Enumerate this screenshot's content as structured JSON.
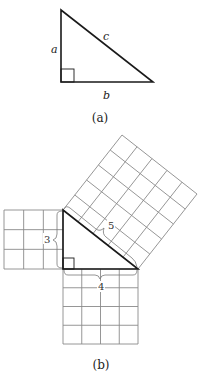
{
  "figure_a": {
    "caption": "(a)",
    "labels": {
      "leg_vertical": "a",
      "leg_horizontal": "b",
      "hypotenuse": "c"
    }
  },
  "figure_b": {
    "caption": "(b)",
    "side_lengths": {
      "short_leg": 3,
      "long_leg": 4,
      "hypotenuse": 5
    },
    "labels": {
      "short_leg": "3",
      "long_leg": "4",
      "hypotenuse": "5"
    },
    "squares": [
      {
        "name": "square-on-short-leg",
        "grid": 3
      },
      {
        "name": "square-on-long-leg",
        "grid": 4
      },
      {
        "name": "square-on-hypotenuse",
        "grid": 5
      }
    ]
  }
}
